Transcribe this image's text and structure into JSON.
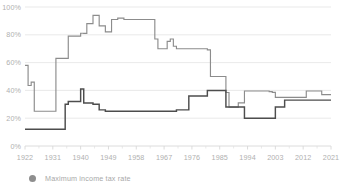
{
  "legend": {
    "entries": [
      {
        "label": "Maximum income tax rate",
        "marker": "circle",
        "color": "#8e8e8e"
      }
    ]
  },
  "axis": {
    "y_ticks": [
      "0%",
      "20%",
      "40%",
      "60%",
      "80%",
      "100%"
    ],
    "x_ticks": [
      "1922",
      "1931",
      "1940",
      "1949",
      "1958",
      "1967",
      "1976",
      "1985",
      "1994",
      "2003",
      "2012",
      "2021"
    ]
  },
  "colors": {
    "series_upper": "#8c8c8c",
    "series_lower": "#4d4d4d",
    "gridline": "#e3e3e3",
    "tick_text": "#b0b0b0",
    "axis_line": "#d8d8d8",
    "background": "#ffffff"
  },
  "chart_data": {
    "type": "line",
    "title": "",
    "xlabel": "",
    "ylabel": "",
    "xlim": [
      1922,
      2021
    ],
    "ylim": [
      0,
      100
    ],
    "grid": true,
    "legend_position": "bottom-left",
    "x": [
      1922,
      1923,
      1924,
      1925,
      1926,
      1927,
      1928,
      1929,
      1930,
      1931,
      1932,
      1933,
      1934,
      1935,
      1936,
      1937,
      1938,
      1939,
      1940,
      1941,
      1942,
      1943,
      1944,
      1945,
      1946,
      1947,
      1948,
      1949,
      1950,
      1951,
      1952,
      1953,
      1954,
      1955,
      1956,
      1957,
      1958,
      1959,
      1960,
      1961,
      1962,
      1963,
      1964,
      1965,
      1966,
      1967,
      1968,
      1969,
      1970,
      1971,
      1972,
      1973,
      1974,
      1975,
      1976,
      1977,
      1978,
      1979,
      1980,
      1981,
      1982,
      1983,
      1984,
      1985,
      1986,
      1987,
      1988,
      1989,
      1990,
      1991,
      1992,
      1993,
      1994,
      1995,
      1996,
      1997,
      1998,
      1999,
      2000,
      2001,
      2002,
      2003,
      2004,
      2005,
      2006,
      2007,
      2008,
      2009,
      2010,
      2011,
      2012,
      2013,
      2014,
      2015,
      2016,
      2017,
      2018,
      2019,
      2020,
      2021
    ],
    "series": [
      {
        "name": "Maximum income tax rate",
        "color": "#8c8c8c",
        "values": [
          58,
          43.5,
          46,
          25,
          25,
          25,
          25,
          25,
          25,
          25,
          63,
          63,
          63,
          63,
          79,
          79,
          79,
          79,
          81.1,
          81,
          88,
          88,
          94,
          94,
          86.45,
          86.45,
          82.13,
          82.13,
          91,
          91,
          92,
          92,
          91,
          91,
          91,
          91,
          91,
          91,
          91,
          91,
          91,
          91,
          77,
          70,
          70,
          70,
          75.25,
          77,
          71.75,
          70,
          70,
          70,
          70,
          70,
          70,
          70,
          70,
          70,
          70,
          69.125,
          50,
          50,
          50,
          50,
          50,
          38.5,
          28,
          28,
          28,
          31,
          31,
          39.6,
          39.6,
          39.6,
          39.6,
          39.6,
          39.6,
          39.6,
          39.6,
          39.1,
          38.6,
          35,
          35,
          35,
          35,
          35,
          35,
          35,
          35,
          35,
          35,
          39.6,
          39.6,
          39.6,
          39.6,
          39.6,
          37,
          37,
          37,
          37
        ]
      },
      {
        "name": "Lower bracket tax rate",
        "color": "#4d4d4d",
        "values": [
          12,
          12,
          12,
          12,
          12,
          12,
          12,
          12,
          12,
          12,
          12,
          12,
          12,
          30,
          32,
          32,
          32,
          32,
          41,
          31,
          31,
          31,
          30,
          30,
          26,
          26,
          25,
          25,
          25,
          25,
          25,
          25,
          25,
          25,
          25,
          25,
          25,
          25,
          25,
          25,
          25,
          25,
          25,
          25,
          25,
          25,
          25,
          25,
          25,
          26,
          26,
          26,
          26,
          36,
          36,
          36,
          36,
          36,
          36,
          40,
          40,
          40,
          40,
          40,
          40,
          28,
          28,
          28,
          28,
          28,
          28,
          20,
          20,
          20,
          20,
          20,
          20,
          20,
          20,
          20,
          20,
          28,
          28,
          28,
          33,
          33,
          33,
          33,
          33,
          33,
          33,
          33,
          33,
          33,
          33,
          33,
          33,
          33,
          33,
          33
        ]
      }
    ]
  }
}
